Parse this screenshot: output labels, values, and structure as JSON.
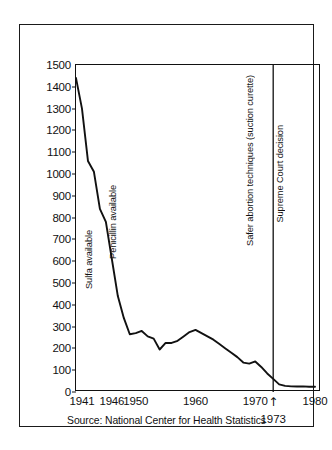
{
  "chart_data": {
    "type": "line",
    "title": "",
    "subtitle": "",
    "xlabel": "",
    "ylabel": "",
    "xlim": [
      1940,
      1981
    ],
    "ylim": [
      0,
      1500
    ],
    "grid": false,
    "legend_position": "none",
    "source_note": "Source: National Center for Health Statistics",
    "y_ticks": [
      0,
      100,
      200,
      300,
      400,
      500,
      600,
      700,
      800,
      900,
      1000,
      1100,
      1200,
      1300,
      1400,
      1500
    ],
    "y_tick_labels": [
      "0",
      "100",
      "200",
      "300",
      "400",
      "500",
      "600",
      "700",
      "800",
      "900",
      "1000",
      "1100",
      "1200",
      "1300",
      "1400",
      "1500"
    ],
    "x_ticks": [
      1941,
      1946,
      1950,
      1960,
      1970,
      1980
    ],
    "x_tick_labels": [
      "1941",
      "1946",
      "1950",
      "1960",
      "1970",
      "1980"
    ],
    "series": [
      {
        "name": "Maternal mortality",
        "color": "#111111",
        "x": [
          1940,
          1941,
          1942,
          1943,
          1944,
          1945,
          1946,
          1947,
          1948,
          1949,
          1950,
          1951,
          1952,
          1953,
          1954,
          1955,
          1956,
          1957,
          1958,
          1959,
          1960,
          1961,
          1962,
          1963,
          1964,
          1965,
          1966,
          1967,
          1968,
          1969,
          1970,
          1971,
          1972,
          1973,
          1974,
          1975,
          1976,
          1977,
          1978,
          1979,
          1980
        ],
        "values": [
          1440,
          1300,
          1060,
          1010,
          840,
          780,
          610,
          440,
          340,
          265,
          270,
          280,
          255,
          245,
          195,
          225,
          225,
          235,
          255,
          275,
          285,
          270,
          255,
          240,
          220,
          200,
          180,
          160,
          135,
          130,
          140,
          115,
          85,
          60,
          35,
          28,
          26,
          25,
          26,
          24,
          24
        ]
      }
    ],
    "annotations": [
      {
        "text": "Sulfa available",
        "x": 1941,
        "orientation": "vertical"
      },
      {
        "text": "Penicillin available",
        "x": 1945,
        "orientation": "vertical"
      },
      {
        "text": "Safer abortion techniques (suction curette)",
        "x": 1968,
        "orientation": "vertical"
      },
      {
        "text": "Supreme Court decision",
        "x": 1973,
        "orientation": "vertical"
      }
    ],
    "marker_line": {
      "x": 1973,
      "label": "1973",
      "arrow": "↑"
    }
  },
  "figure": {
    "source_note": "Source: National Center for Health Statistics"
  },
  "axis": {
    "y_labels": [
      "1500",
      "1400",
      "1300",
      "1200",
      "1100",
      "1000",
      "900",
      "800",
      "700",
      "600",
      "500",
      "400",
      "300",
      "200",
      "100",
      "0"
    ],
    "x_labels": [
      "1941",
      "1946",
      "1950",
      "1960",
      "1970",
      "1980"
    ]
  },
  "annotations": {
    "sulfa": "Sulfa available",
    "penicillin": "Penicillin available",
    "abortion": "Safer abortion techniques (suction curette)",
    "court": "Supreme Court decision",
    "marker_year": "1973",
    "marker_arrow": "↑"
  }
}
